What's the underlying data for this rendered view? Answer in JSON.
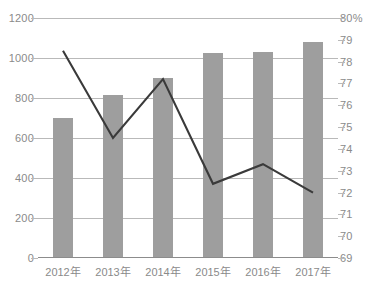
{
  "chart_data": {
    "type": "bar",
    "title": "",
    "xlabel": "",
    "ylabel": "",
    "categories": [
      "2012年",
      "2013年",
      "2014年",
      "2015年",
      "2016年",
      "2017年"
    ],
    "series": [
      {
        "name": "bars",
        "type": "bar",
        "axis": "left",
        "color": "#9e9e9e",
        "values": [
          700,
          815,
          900,
          1025,
          1030,
          1080
        ]
      },
      {
        "name": "line",
        "type": "line",
        "axis": "right",
        "color": "#3a3a3a",
        "values": [
          78.5,
          74.5,
          77.2,
          72.4,
          73.3,
          72.0
        ]
      }
    ],
    "ylim": [
      0,
      1200
    ],
    "y2lim": [
      69,
      80
    ],
    "left_ticks": [
      "0",
      "200",
      "400",
      "600",
      "800",
      "1000",
      "1200"
    ],
    "left_tick_values": [
      0,
      200,
      400,
      600,
      800,
      1000,
      1200
    ],
    "right_ticks": [
      "69",
      "70",
      "71",
      "72",
      "73",
      "74",
      "75",
      "76",
      "77",
      "78",
      "79",
      "80%"
    ],
    "right_tick_values": [
      69,
      70,
      71,
      72,
      73,
      74,
      75,
      76,
      77,
      78,
      79,
      80
    ],
    "grid": true,
    "gridline_values": [
      200,
      400,
      600,
      800,
      1000,
      1200
    ],
    "legend": [],
    "legend_position": "none",
    "colors": {
      "bar": "#9e9e9e",
      "line": "#3a3a3a",
      "grid": "#b9b9b9",
      "axis_text": "#8a8a8a",
      "baseline": "#8c8c8c",
      "background": "#ffffff"
    }
  }
}
